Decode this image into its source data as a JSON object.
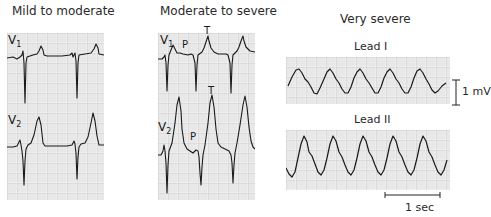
{
  "figure": {
    "panels": [
      {
        "title": "Mild to moderate",
        "leads": [
          {
            "label": "V",
            "sub": "1"
          },
          {
            "label": "V",
            "sub": "2"
          }
        ]
      },
      {
        "title": "Moderate to severe",
        "leads": [
          {
            "label": "V",
            "sub": "1",
            "wave_labels": [
              "P",
              "T"
            ]
          },
          {
            "label": "V",
            "sub": "2",
            "wave_labels": [
              "T",
              "P"
            ]
          }
        ]
      },
      {
        "title": "Very severe",
        "leads": [
          {
            "label": "Lead I"
          },
          {
            "label": "Lead II"
          }
        ],
        "amplitude_scale": "1 mV",
        "time_scale": "1 sec"
      }
    ],
    "colors": {
      "grid_minor": "#d4d4d4",
      "grid_major": "#b8b8b8",
      "trace": "#1a1a1a",
      "background": "#ffffff"
    }
  }
}
